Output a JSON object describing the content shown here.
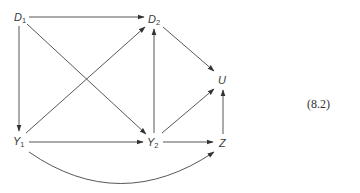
{
  "diagram": {
    "equation_number": "(8.2)",
    "nodes": [
      {
        "id": "D1",
        "base": "D",
        "sub": "1",
        "x": 20,
        "y": 17
      },
      {
        "id": "D2",
        "base": "D",
        "sub": "2",
        "x": 154,
        "y": 19
      },
      {
        "id": "U",
        "base": "U",
        "sub": "",
        "x": 222,
        "y": 80
      },
      {
        "id": "Y1",
        "base": "Y",
        "sub": "1",
        "x": 19,
        "y": 141
      },
      {
        "id": "Y2",
        "base": "Y",
        "sub": "2",
        "x": 153,
        "y": 142
      },
      {
        "id": "Z",
        "base": "Z",
        "sub": "",
        "x": 223,
        "y": 143
      }
    ],
    "edges": [
      {
        "from": "D1",
        "to": "D2",
        "type": "straight"
      },
      {
        "from": "D1",
        "to": "Y1",
        "type": "straight"
      },
      {
        "from": "D1",
        "to": "Y2",
        "type": "straight"
      },
      {
        "from": "Y1",
        "to": "D2",
        "type": "straight"
      },
      {
        "from": "Y2",
        "to": "D2",
        "type": "straight"
      },
      {
        "from": "D2",
        "to": "U",
        "type": "straight"
      },
      {
        "from": "Y1",
        "to": "Y2",
        "type": "straight"
      },
      {
        "from": "Y2",
        "to": "U",
        "type": "straight"
      },
      {
        "from": "Y2",
        "to": "Z",
        "type": "straight"
      },
      {
        "from": "Z",
        "to": "U",
        "type": "straight"
      },
      {
        "from": "Y1",
        "to": "Z",
        "type": "curved"
      }
    ],
    "colors": {
      "edge": "#444444",
      "text": "#3a3a3a",
      "background": "#ffffff"
    }
  }
}
